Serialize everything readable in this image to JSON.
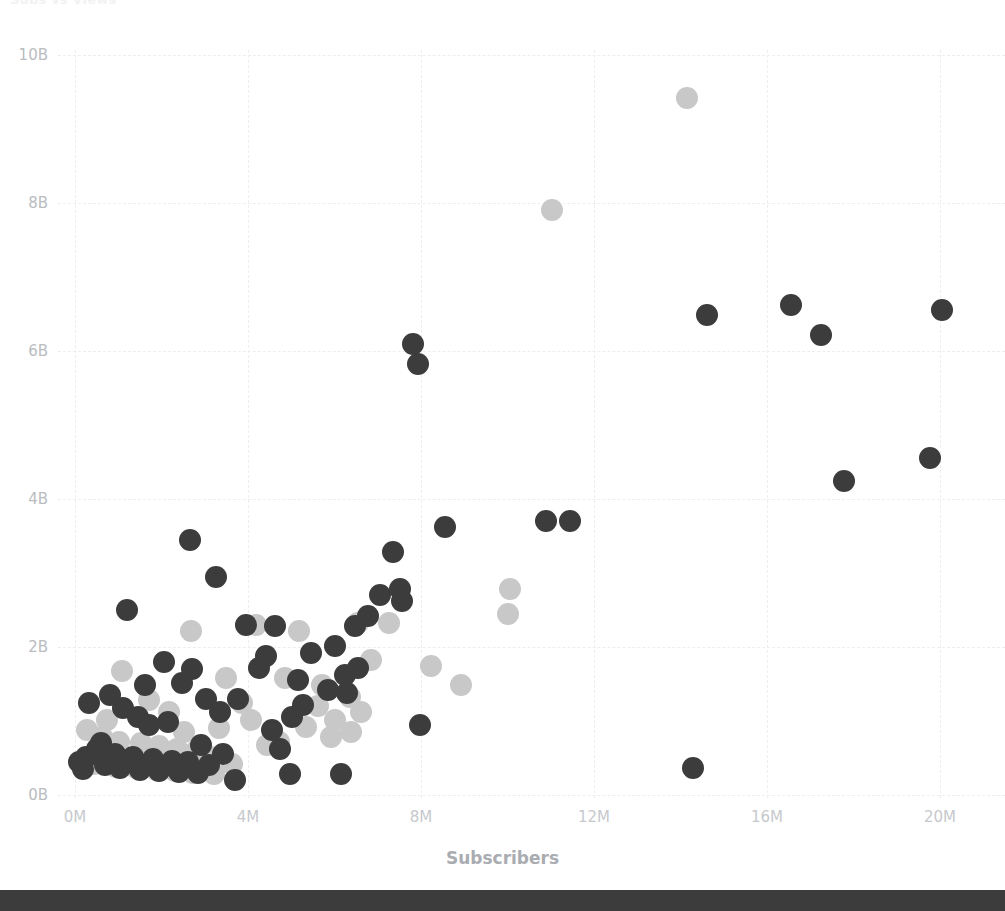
{
  "chart_data": {
    "type": "scatter",
    "title": "Subs vs Views",
    "xlabel": "Subscribers",
    "ylabel": "",
    "xlim": [
      0,
      21000000
    ],
    "ylim": [
      0,
      10600000000
    ],
    "grid": true,
    "legend_position": "none",
    "x_ticks": [
      {
        "label": "0M",
        "value": 0
      },
      {
        "label": "4M",
        "value": 4000000
      },
      {
        "label": "8M",
        "value": 8000000
      },
      {
        "label": "12M",
        "value": 12000000
      },
      {
        "label": "16M",
        "value": 16000000
      },
      {
        "label": "20M",
        "value": 20000000
      }
    ],
    "y_ticks": [
      {
        "label": "0B",
        "value": 0
      },
      {
        "label": "2B",
        "value": 2000000000
      },
      {
        "label": "4B",
        "value": 4000000000
      },
      {
        "label": "6B",
        "value": 6000000000
      },
      {
        "label": "8B",
        "value": 8000000000
      },
      {
        "label": "10B",
        "value": 10000000000
      }
    ],
    "colors": {
      "series_dark": "#3c3c3c",
      "series_light": "#c8c8c8",
      "gridline": "#eceef0",
      "tick_text": "#c0c3c7",
      "axis_title": "#a9acb1",
      "background": "#ffffff",
      "bottom_bar": "#3c3c3c"
    },
    "marker_radius_px": 11,
    "series": [
      {
        "name": "dark",
        "color": "#3c3c3c",
        "points": [
          [
            14.29,
            0.36
          ],
          [
            3.7,
            0.2
          ],
          [
            4.98,
            0.29
          ],
          [
            6.14,
            0.28
          ],
          [
            0.6,
            0.7
          ],
          [
            1.2,
            2.5
          ],
          [
            0.33,
            1.25
          ],
          [
            0.82,
            1.35
          ],
          [
            2.65,
            3.45
          ],
          [
            3.25,
            2.95
          ],
          [
            2.05,
            1.8
          ],
          [
            2.7,
            1.7
          ],
          [
            1.1,
            1.18
          ],
          [
            1.45,
            1.05
          ],
          [
            1.7,
            0.95
          ],
          [
            2.15,
            0.98
          ],
          [
            0.5,
            0.62
          ],
          [
            0.92,
            0.55
          ],
          [
            1.35,
            0.52
          ],
          [
            1.8,
            0.48
          ],
          [
            2.25,
            0.46
          ],
          [
            2.62,
            0.44
          ],
          [
            3.1,
            0.4
          ],
          [
            0.25,
            0.52
          ],
          [
            0.7,
            0.4
          ],
          [
            1.05,
            0.36
          ],
          [
            1.5,
            0.34
          ],
          [
            1.95,
            0.32
          ],
          [
            2.4,
            0.31
          ],
          [
            2.85,
            0.3
          ],
          [
            1.62,
            1.48
          ],
          [
            2.48,
            1.52
          ],
          [
            3.02,
            1.3
          ],
          [
            3.35,
            1.12
          ],
          [
            3.78,
            1.3
          ],
          [
            4.25,
            1.72
          ],
          [
            4.55,
            0.88
          ],
          [
            4.75,
            0.62
          ],
          [
            5.15,
            1.55
          ],
          [
            5.45,
            1.92
          ],
          [
            5.85,
            1.42
          ],
          [
            6.02,
            2.02
          ],
          [
            6.25,
            1.62
          ],
          [
            6.3,
            1.38
          ],
          [
            6.48,
            2.28
          ],
          [
            6.55,
            1.72
          ],
          [
            6.78,
            2.42
          ],
          [
            7.05,
            2.7
          ],
          [
            7.35,
            3.28
          ],
          [
            7.52,
            2.78
          ],
          [
            7.55,
            2.62
          ],
          [
            7.98,
            0.95
          ],
          [
            8.55,
            3.62
          ],
          [
            10.9,
            3.7
          ],
          [
            11.45,
            3.7
          ],
          [
            7.82,
            6.1
          ],
          [
            7.92,
            5.82
          ],
          [
            14.62,
            6.48
          ],
          [
            16.55,
            6.62
          ],
          [
            17.25,
            6.22
          ],
          [
            17.78,
            4.25
          ],
          [
            20.05,
            6.55
          ],
          [
            19.78,
            4.55
          ],
          [
            3.95,
            2.3
          ],
          [
            4.42,
            1.88
          ],
          [
            4.62,
            2.28
          ],
          [
            5.02,
            1.05
          ],
          [
            5.28,
            1.22
          ],
          [
            0.1,
            0.45
          ],
          [
            0.18,
            0.35
          ],
          [
            2.92,
            0.68
          ],
          [
            3.42,
            0.55
          ]
        ]
      },
      {
        "name": "light",
        "color": "#c8c8c8",
        "points": [
          [
            14.15,
            9.42
          ],
          [
            11.02,
            7.9
          ],
          [
            10.05,
            2.78
          ],
          [
            10.02,
            2.45
          ],
          [
            2.68,
            2.22
          ],
          [
            4.18,
            2.3
          ],
          [
            5.18,
            2.22
          ],
          [
            6.55,
            2.32
          ],
          [
            1.08,
            1.68
          ],
          [
            3.48,
            1.58
          ],
          [
            4.85,
            1.58
          ],
          [
            5.72,
            1.48
          ],
          [
            6.35,
            1.32
          ],
          [
            6.62,
            1.12
          ],
          [
            8.22,
            1.75
          ],
          [
            8.92,
            1.48
          ],
          [
            0.28,
            0.88
          ],
          [
            0.62,
            0.78
          ],
          [
            1.02,
            0.72
          ],
          [
            1.52,
            0.7
          ],
          [
            1.95,
            0.66
          ],
          [
            2.35,
            0.62
          ],
          [
            2.78,
            0.58
          ],
          [
            3.12,
            0.52
          ],
          [
            0.45,
            0.42
          ],
          [
            0.95,
            0.38
          ],
          [
            1.42,
            0.36
          ],
          [
            1.88,
            0.34
          ],
          [
            2.32,
            0.32
          ],
          [
            2.72,
            0.3
          ],
          [
            3.22,
            0.28
          ],
          [
            3.62,
            0.42
          ],
          [
            4.08,
            1.02
          ],
          [
            4.45,
            0.68
          ],
          [
            4.72,
            0.72
          ],
          [
            5.35,
            0.92
          ],
          [
            5.62,
            1.2
          ],
          [
            6.02,
            1.02
          ],
          [
            6.38,
            0.85
          ],
          [
            3.85,
            1.25
          ],
          [
            2.18,
            1.12
          ],
          [
            1.72,
            1.28
          ],
          [
            0.75,
            1.02
          ],
          [
            7.25,
            2.32
          ],
          [
            6.85,
            1.82
          ],
          [
            5.92,
            0.78
          ],
          [
            2.52,
            0.85
          ],
          [
            3.32,
            0.9
          ]
        ]
      }
    ]
  },
  "window": {
    "bottom_bar_present": true
  }
}
